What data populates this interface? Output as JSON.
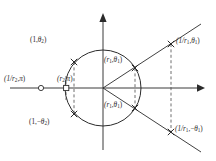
{
  "figure": {
    "background": "#ffffff",
    "ink_color": "#2b2b2b",
    "width": 216,
    "height": 161
  },
  "axes": {
    "origin": {
      "x": 103,
      "y": 88
    },
    "x_axis": {
      "name": "horizontal-axis",
      "x1": 10,
      "y1": 88,
      "x2": 203,
      "y2": 88,
      "arrow": "right"
    },
    "y_axis": {
      "name": "vertical-axis",
      "x1": 103,
      "y1": 150,
      "x2": 103,
      "y2": 14,
      "arrow": "up"
    }
  },
  "unit_circle": {
    "name": "unit-circle",
    "cx": 103,
    "cy": 88,
    "r": 38,
    "stroke": "#2b2b2b"
  },
  "rays": [
    {
      "name": "ray-upper-theta1",
      "x1": 103,
      "y1": 88,
      "x2": 200,
      "y2": 25
    },
    {
      "name": "ray-lower-theta1",
      "x1": 103,
      "y1": 88,
      "x2": 200,
      "y2": 151
    }
  ],
  "points": [
    {
      "id": "p-1-theta2",
      "label": "(1, θ2)",
      "x": 74,
      "y": 62,
      "marker": "cross"
    },
    {
      "id": "p-1-neg-theta2",
      "label": "(1, −θ2)",
      "x": 74,
      "y": 114,
      "marker": "cross"
    },
    {
      "id": "p-r1-theta1",
      "label": "(r1, θ1)",
      "x": 135,
      "y": 68,
      "marker": "cross"
    },
    {
      "id": "p-r1-neg-theta1",
      "label": "(r1, −θ1)",
      "x": 135,
      "y": 108,
      "marker": "cross"
    },
    {
      "id": "p-inv-r1-theta1",
      "label": "(1/r1, θ1)",
      "x": 171,
      "y": 44,
      "marker": "cross"
    },
    {
      "id": "p-inv-r1-neg-theta1",
      "label": "(1/r1, −θ1)",
      "x": 171,
      "y": 132,
      "marker": "cross"
    },
    {
      "id": "p-inv-r2-pi",
      "label": "(1/r2, π)",
      "x": 41,
      "y": 88,
      "marker": "open-circle"
    },
    {
      "id": "p-r2-pi",
      "label": "(r2, π)",
      "x": 66,
      "y": 88,
      "marker": "open-square"
    }
  ],
  "dashed_connectors": [
    {
      "name": "dashed-left-vertical",
      "x": 74,
      "y1": 62,
      "y2": 114
    },
    {
      "name": "dashed-mid-vertical",
      "x": 135,
      "y1": 68,
      "y2": 108
    },
    {
      "name": "dashed-right-vertical",
      "x": 171,
      "y1": 44,
      "y2": 132
    },
    {
      "name": "dashed-marker-vertical",
      "x": 66,
      "y1": 78,
      "y2": 98
    }
  ],
  "labels": {
    "top_left": {
      "name": "label-1-theta2",
      "x": 31,
      "y": 42,
      "paren_open": "(1,",
      "value": "θ",
      "sub": "2",
      "paren_close": ")"
    },
    "bottom_left": {
      "name": "label-1-neg-theta2",
      "x": 30,
      "y": 124,
      "paren_open": "(1,−",
      "value": "θ",
      "sub": "2",
      "paren_close": ")"
    },
    "center_upper": {
      "name": "label-r1-theta1",
      "x": 105,
      "y": 62,
      "paren_open": "(r",
      "sub1": "1",
      "comma": ",",
      "value": "θ",
      "sub": "1",
      "paren_close": ")"
    },
    "center_lower": {
      "name": "label-r1-neg-theta1",
      "x": 105,
      "y": 107,
      "paren_open": "(r",
      "sub1": "1",
      "comma": ",",
      "value": "θ",
      "sub": "1",
      "paren_close": ")"
    },
    "right_upper": {
      "name": "label-inv-r1-theta1",
      "x": 175,
      "y": 42,
      "paren_open": "(1/r",
      "sub1": "1",
      "comma": ",",
      "value": "θ",
      "sub": "1",
      "paren_close": ")"
    },
    "right_lower": {
      "name": "label-inv-r1-neg-theta1",
      "x": 174,
      "y": 131,
      "paren_open": "(1/r",
      "sub1": "1",
      "comma": ",−",
      "value": "θ",
      "sub": "1",
      "paren_close": ")"
    },
    "far_left": {
      "name": "label-inv-r2-pi",
      "x": 5,
      "y": 80,
      "paren_open": "(1/r",
      "sub1": "2",
      "comma": ",",
      "value": "π",
      "paren_close": ")"
    },
    "near_left": {
      "name": "label-r2-pi",
      "x": 58,
      "y": 80,
      "paren_open": "(r",
      "sub1": "2",
      "comma": ",",
      "value": "π",
      "paren_close": ")"
    }
  }
}
